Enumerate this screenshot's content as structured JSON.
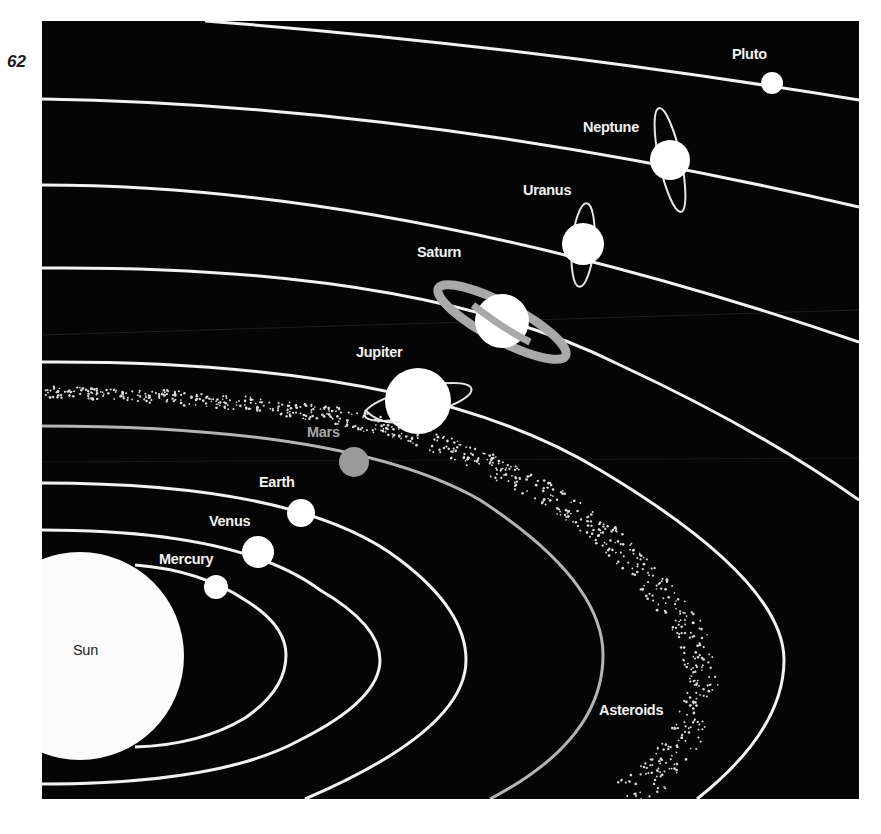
{
  "page": {
    "number": "62"
  },
  "colors": {
    "background": "#050505",
    "orbit": "#f2f2f2",
    "mars_orbit": "#b0b0b0",
    "planet": "#ffffff",
    "mars": "#9a9a9a",
    "saturn_ring": "#a9a9a9",
    "sun": "#fbfbfb",
    "asteroids": "#dcdcdc"
  },
  "labels": {
    "sun": "Sun",
    "mercury": "Mercury",
    "venus": "Venus",
    "earth": "Earth",
    "mars": "Mars",
    "jupiter": "Jupiter",
    "saturn": "Saturn",
    "uranus": "Uranus",
    "neptune": "Neptune",
    "pluto": "Pluto",
    "asteroids": "Asteroids"
  },
  "bodies": [
    {
      "name": "Sun",
      "kind": "star"
    },
    {
      "name": "Mercury",
      "kind": "planet"
    },
    {
      "name": "Venus",
      "kind": "planet"
    },
    {
      "name": "Earth",
      "kind": "planet"
    },
    {
      "name": "Mars",
      "kind": "planet",
      "shade": "gray"
    },
    {
      "name": "Jupiter",
      "kind": "planet",
      "ring": "thin"
    },
    {
      "name": "Saturn",
      "kind": "planet",
      "ring": "wide-gray"
    },
    {
      "name": "Uranus",
      "kind": "planet",
      "ring": "vertical"
    },
    {
      "name": "Neptune",
      "kind": "planet",
      "ring": "vertical"
    },
    {
      "name": "Pluto",
      "kind": "planet"
    }
  ],
  "belt": {
    "name": "Asteroids",
    "position": "between Mars and Jupiter"
  }
}
